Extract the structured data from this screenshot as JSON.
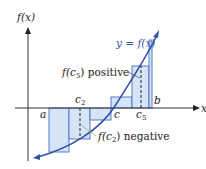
{
  "diagram": {
    "axes": {
      "y_label": "f(x)",
      "x_label": "x"
    },
    "curve_label": "y = f(x)",
    "points": {
      "a": "a",
      "b": "b",
      "c": "c",
      "c2": "c",
      "c2_sub": "2",
      "c5": "c",
      "c5_sub": "5"
    },
    "annotations": {
      "positive": {
        "prefix": "f(c",
        "sub": "5",
        "suffix": ") positive"
      },
      "negative": {
        "prefix": "f(c",
        "sub": "2",
        "suffix": ") negative"
      }
    },
    "colors": {
      "rect_fill": "#d6e4f7",
      "rect_stroke": "#4a6fc0",
      "curve": "#2f4fa8",
      "axis": "#333333",
      "leader": "#555555"
    },
    "rectangles": [
      {
        "x0": 49,
        "x1": 69,
        "y": 152,
        "sign": "negative"
      },
      {
        "x0": 69,
        "x1": 90,
        "y": 139,
        "sign": "negative"
      },
      {
        "x0": 90,
        "x1": 111,
        "y": 120,
        "sign": "negative"
      },
      {
        "x0": 111,
        "x1": 132,
        "y": 97,
        "sign": "positive"
      },
      {
        "x0": 132,
        "x1": 149,
        "y": 66,
        "sign": "positive"
      },
      {
        "x0": 149,
        "x1": 152,
        "y": 40,
        "sign": "positive"
      }
    ]
  }
}
